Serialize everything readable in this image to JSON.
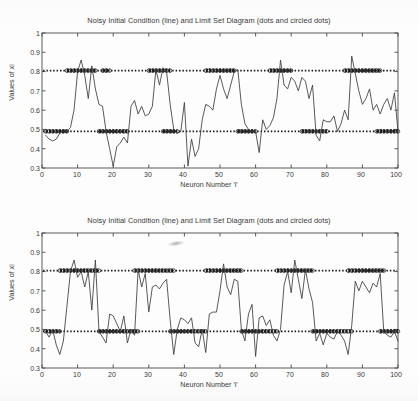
{
  "figure": {
    "background": "#fdfdfd",
    "axis_color": "#4a4a4a",
    "line_color": "#3c3c3c",
    "dot_color": "#1a1a1a"
  },
  "panels": [
    {
      "id": "panel-0",
      "title": "Noisy Initial Condition (line) and Limit Set Diagram (dots and circled dots)",
      "xlabel": "Neuron Number 'i'",
      "ylabel": "Values of xi",
      "xticks": [
        "0",
        "10",
        "20",
        "30",
        "40",
        "50",
        "60",
        "70",
        "80",
        "90",
        "100"
      ],
      "yticks": [
        "0.3",
        "0.4",
        "0.5",
        "0.6",
        "0.7",
        "0.8",
        "0.9",
        "1"
      ]
    },
    {
      "id": "panel-1",
      "title": "Noisy Initial Condition (line) and Limit Set Diagram (dots and circled dots)",
      "xlabel": "Neuron Number 'i'",
      "ylabel": "Values of xi",
      "xticks": [
        "0",
        "10",
        "20",
        "30",
        "40",
        "50",
        "60",
        "70",
        "80",
        "90",
        "100"
      ],
      "yticks": [
        "0.3",
        "0.4",
        "0.5",
        "0.6",
        "0.7",
        "0.8",
        "0.9",
        "1"
      ]
    }
  ],
  "chart_data": [
    {
      "type": "line",
      "title": "Noisy Initial Condition (line) and Limit Set Diagram (dots and circled dots)",
      "xlabel": "Neuron Number 'i'",
      "ylabel": "Values of xi",
      "xlim": [
        0,
        100
      ],
      "ylim": [
        0.3,
        1
      ],
      "grid": false,
      "legend": "none",
      "series": [
        {
          "name": "Noisy Initial Condition (line)",
          "x": [
            1,
            2,
            3,
            4,
            5,
            6,
            7,
            8,
            9,
            10,
            11,
            12,
            13,
            14,
            15,
            16,
            17,
            18,
            19,
            20,
            21,
            22,
            23,
            24,
            25,
            26,
            27,
            28,
            29,
            30,
            31,
            32,
            33,
            34,
            35,
            36,
            37,
            38,
            39,
            40,
            41,
            42,
            43,
            44,
            45,
            46,
            47,
            48,
            49,
            50,
            51,
            52,
            53,
            54,
            55,
            56,
            57,
            58,
            59,
            60,
            61,
            62,
            63,
            64,
            65,
            66,
            67,
            68,
            69,
            70,
            71,
            72,
            73,
            74,
            75,
            76,
            77,
            78,
            79,
            80,
            81,
            82,
            83,
            84,
            85,
            86,
            87,
            88,
            89,
            90,
            91,
            92,
            93,
            94,
            95,
            96,
            97,
            98,
            99,
            100
          ],
          "values": [
            0.47,
            0.45,
            0.44,
            0.45,
            0.48,
            0.5,
            0.49,
            0.51,
            0.6,
            0.8,
            0.86,
            0.78,
            0.66,
            0.83,
            0.71,
            0.63,
            0.62,
            0.49,
            0.4,
            0.31,
            0.41,
            0.43,
            0.46,
            0.43,
            0.62,
            0.65,
            0.58,
            0.62,
            0.57,
            0.58,
            0.62,
            0.81,
            0.73,
            0.82,
            0.8,
            0.63,
            0.5,
            0.48,
            0.49,
            0.64,
            0.31,
            0.45,
            0.36,
            0.4,
            0.55,
            0.63,
            0.62,
            0.6,
            0.71,
            0.78,
            0.71,
            0.66,
            0.73,
            0.8,
            0.81,
            0.63,
            0.53,
            0.5,
            0.49,
            0.49,
            0.38,
            0.55,
            0.5,
            0.52,
            0.56,
            0.66,
            0.86,
            0.73,
            0.71,
            0.77,
            0.75,
            0.7,
            0.77,
            0.75,
            0.66,
            0.73,
            0.47,
            0.44,
            0.55,
            0.54,
            0.54,
            0.57,
            0.49,
            0.53,
            0.6,
            0.55,
            0.88,
            0.79,
            0.7,
            0.63,
            0.66,
            0.71,
            0.6,
            0.63,
            0.58,
            0.63,
            0.66,
            0.6,
            0.69,
            0.49
          ]
        },
        {
          "name": "Limit Set Diagram (dots)",
          "description": "Dense dotted horizontal rows marking the two attractor levels, drawn across all neurons",
          "levels": [
            0.805,
            0.49
          ]
        },
        {
          "name": "Limit Set Diagram (circled dots)",
          "description": "Thicker circled-dot clusters marking neurons belonging to each limit-set band",
          "upper_level": 0.805,
          "upper_bands": [
            [
              7,
              15
            ],
            [
              17,
              19
            ],
            [
              30,
              36
            ],
            [
              46,
              54
            ],
            [
              64,
              70
            ],
            [
              85,
              95
            ]
          ],
          "lower_level": 0.49,
          "lower_bands": [
            [
              1,
              7
            ],
            [
              16,
              24
            ],
            [
              34,
              38
            ],
            [
              55,
              60
            ],
            [
              73,
              80
            ],
            [
              94,
              100
            ]
          ]
        }
      ]
    },
    {
      "type": "line",
      "title": "Noisy Initial Condition (line) and Limit Set Diagram (dots and circled dots)",
      "xlabel": "Neuron Number 'i'",
      "ylabel": "Values of xi",
      "xlim": [
        0,
        100
      ],
      "ylim": [
        0.3,
        1
      ],
      "grid": false,
      "legend": "none",
      "series": [
        {
          "name": "Noisy Initial Condition (line)",
          "x": [
            1,
            2,
            3,
            4,
            5,
            6,
            7,
            8,
            9,
            10,
            11,
            12,
            13,
            14,
            15,
            16,
            17,
            18,
            19,
            20,
            21,
            22,
            23,
            24,
            25,
            26,
            27,
            28,
            29,
            30,
            31,
            32,
            33,
            34,
            35,
            36,
            37,
            38,
            39,
            40,
            41,
            42,
            43,
            44,
            45,
            46,
            47,
            48,
            49,
            50,
            51,
            52,
            53,
            54,
            55,
            56,
            57,
            58,
            59,
            60,
            61,
            62,
            63,
            64,
            65,
            66,
            67,
            68,
            69,
            70,
            71,
            72,
            73,
            74,
            75,
            76,
            77,
            78,
            79,
            80,
            81,
            82,
            83,
            84,
            85,
            86,
            87,
            88,
            89,
            90,
            91,
            92,
            93,
            94,
            95,
            96,
            97,
            98,
            99,
            100
          ],
          "values": [
            0.49,
            0.46,
            0.5,
            0.42,
            0.37,
            0.44,
            0.62,
            0.8,
            0.86,
            0.77,
            0.8,
            0.72,
            0.8,
            0.6,
            0.86,
            0.49,
            0.46,
            0.43,
            0.58,
            0.57,
            0.53,
            0.49,
            0.57,
            0.43,
            0.5,
            0.47,
            0.81,
            0.72,
            0.79,
            0.59,
            0.72,
            0.73,
            0.71,
            0.74,
            0.76,
            0.55,
            0.37,
            0.5,
            0.56,
            0.55,
            0.53,
            0.56,
            0.43,
            0.41,
            0.5,
            0.38,
            0.58,
            0.59,
            0.59,
            0.7,
            0.84,
            0.72,
            0.68,
            0.76,
            0.75,
            0.5,
            0.44,
            0.58,
            0.63,
            0.36,
            0.56,
            0.57,
            0.52,
            0.55,
            0.47,
            0.44,
            0.5,
            0.73,
            0.8,
            0.69,
            0.86,
            0.76,
            0.66,
            0.81,
            0.71,
            0.64,
            0.44,
            0.48,
            0.42,
            0.48,
            0.46,
            0.45,
            0.49,
            0.47,
            0.44,
            0.37,
            0.52,
            0.75,
            0.7,
            0.75,
            0.72,
            0.69,
            0.74,
            0.72,
            0.79,
            0.49,
            0.47,
            0.46,
            0.49,
            0.44
          ]
        },
        {
          "name": "Limit Set Diagram (dots)",
          "description": "Dense dotted horizontal rows marking the two attractor levels, drawn across all neurons",
          "levels": [
            0.805,
            0.49
          ]
        },
        {
          "name": "Limit Set Diagram (circled dots)",
          "description": "Thicker circled-dot clusters marking neurons belonging to each limit-set band",
          "upper_level": 0.805,
          "upper_bands": [
            [
              5,
              16
            ],
            [
              26,
              37
            ],
            [
              46,
              56
            ],
            [
              66,
              76
            ],
            [
              86,
              96
            ]
          ],
          "lower_level": 0.49,
          "lower_bands": [
            [
              1,
              5
            ],
            [
              16,
              27
            ],
            [
              36,
              46
            ],
            [
              56,
              66
            ],
            [
              76,
              87
            ],
            [
              95,
              100
            ]
          ]
        }
      ]
    }
  ]
}
